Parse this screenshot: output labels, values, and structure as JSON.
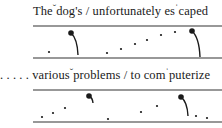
{
  "diagram": {
    "type": "intonation-contour",
    "rows": [
      {
        "text_parts": [
          "The",
          "ˇ",
          "dog's",
          " / ",
          "unfortunately es",
          "ˈ",
          "caped"
        ],
        "leading_dots": "",
        "contour": {
          "staff_top_y": 26,
          "staff_bottom_y": 58,
          "x_start": 33,
          "x_end": 222,
          "small_dots": [
            [
              49,
              52
            ],
            [
              107,
              53
            ],
            [
              121,
              49
            ],
            [
              135,
              44
            ],
            [
              147,
              40
            ],
            [
              161,
              35
            ],
            [
              175,
              32
            ]
          ],
          "accent_dots": [
            {
              "x": 71,
              "y": 33,
              "tail_to": [
                78,
                55
              ]
            },
            {
              "x": 192,
              "y": 31,
              "tail_to": [
                200,
                57
              ]
            }
          ]
        }
      },
      {
        "text_parts": [
          "various",
          "ˇ",
          "problems",
          " / ",
          "to com",
          "ˈ",
          "puterize"
        ],
        "leading_dots": ". . . . .",
        "contour": {
          "staff_top_y": 90,
          "staff_bottom_y": 122,
          "x_start": 33,
          "x_end": 222,
          "small_dots": [
            [
              42,
              117
            ],
            [
              53,
              113
            ],
            [
              65,
              108
            ],
            [
              108,
              119
            ],
            [
              141,
              112
            ],
            [
              157,
              106
            ],
            [
              196,
              116
            ],
            [
              207,
              118
            ]
          ],
          "accent_dots": [
            {
              "x": 89,
              "y": 96,
              "tail_to": [
                93,
                103
              ]
            },
            {
              "x": 181,
              "y": 97,
              "tail_to": [
                188,
                116
              ]
            }
          ]
        }
      }
    ],
    "colors": {
      "ink": "#1a1a1a",
      "staff": "#333333"
    }
  }
}
